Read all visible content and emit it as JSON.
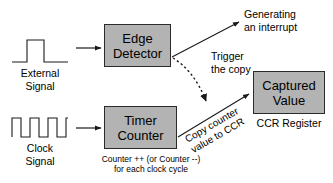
{
  "diagram": {
    "colors": {
      "box_fill": "#b3b3b3",
      "box_border": "#2b2b2b",
      "line": "#1a1a1a",
      "background": "#ffffff"
    },
    "boxes": [
      {
        "id": "edge_detector",
        "line1": "Edge",
        "line2": "Detector"
      },
      {
        "id": "timer_counter",
        "line1": "Timer",
        "line2": "Counter"
      },
      {
        "id": "captured_value",
        "line1": "Captured",
        "line2": "Value"
      }
    ],
    "signals": [
      {
        "id": "external_signal",
        "line1": "External",
        "line2": "Signal",
        "waveform": "single-pulse"
      },
      {
        "id": "clock_signal",
        "line1": "Clock",
        "line2": "Signal",
        "waveform": "square-wave-3-pulses"
      }
    ],
    "annotations": {
      "interrupt_line1": "Generating",
      "interrupt_line2": "an interrupt",
      "trigger_line1": "Trigger",
      "trigger_line2": "the copy",
      "copy_line1": "Copy counter",
      "copy_line2": "value to CCR",
      "ccr_register": "CCR Register",
      "counter_caption_line1": "Counter ++ (or Counter --)",
      "counter_caption_line2": "for each clock cycle"
    }
  }
}
